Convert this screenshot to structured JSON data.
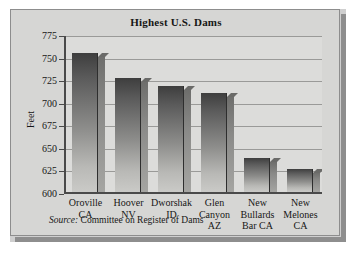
{
  "chart_data": {
    "type": "bar",
    "title": "Highest U.S. Dams",
    "xlabel": "",
    "ylabel": "Feet",
    "ylim": [
      600,
      775
    ],
    "ytick_step": 25,
    "yticks": [
      600,
      625,
      650,
      675,
      700,
      725,
      750,
      775
    ],
    "grid": true,
    "legend": "none",
    "categories": [
      "Oroville\nCA",
      "Hoover\nNV",
      "Dworshak\nID",
      "Glen\nCanyon\nAZ",
      "New\nBullards\nBar CA",
      "New\nMelones\nCA"
    ],
    "values": [
      754,
      726,
      717,
      710,
      638,
      626
    ],
    "units": "feet",
    "source": {
      "label": "Source:",
      "text": "Committee on Register of Dams"
    }
  },
  "colors": {
    "card_background": "#d6d6d4",
    "plot_background": "#dcdcda",
    "axis": "#4a4a4a",
    "gridline": "#9a9a98",
    "bar_dark": "#3e3e3e",
    "bar_light": "#cacac7",
    "bar_side": "#8a8a88",
    "text": "#161616",
    "frame_shadow": "#8e8e8e"
  },
  "decoration": {
    "logo_name": "dam-illustration"
  }
}
